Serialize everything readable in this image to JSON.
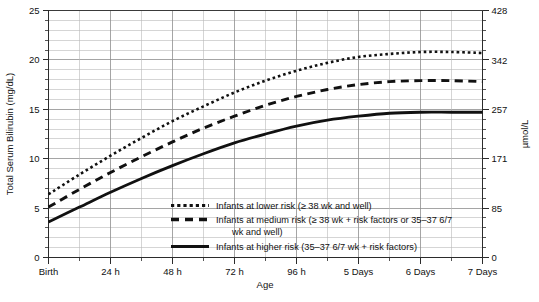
{
  "chart_data": {
    "type": "line",
    "title": "",
    "xlabel": "Age",
    "ylabel": "Total Serum Bilirubin (mg/dL)",
    "ylabel_right": "µmol/L",
    "grid": true,
    "legend_position": "inside-bottom-center",
    "x_tick_labels": [
      "Birth",
      "24 h",
      "48 h",
      "72 h",
      "96 h",
      "5 Days",
      "6 Days",
      "7 Days"
    ],
    "x_tick_hours": [
      0,
      24,
      48,
      72,
      96,
      120,
      144,
      168
    ],
    "xlim_hours": [
      0,
      168
    ],
    "y_tick_labels": [
      "0",
      "5",
      "10",
      "15",
      "20",
      "25"
    ],
    "y_tick_values": [
      0,
      5,
      10,
      15,
      20,
      25
    ],
    "ylim": [
      0,
      25
    ],
    "y_right_tick_labels": [
      "0",
      "85",
      "171",
      "257",
      "342",
      "428"
    ],
    "y_right_tick_values": [
      0,
      85,
      171,
      257,
      342,
      428
    ],
    "y_right_lim": [
      0,
      428
    ],
    "x": [
      0,
      12,
      24,
      36,
      48,
      60,
      72,
      84,
      96,
      108,
      120,
      132,
      144,
      156,
      168
    ],
    "series": [
      {
        "name": "Infants at lower risk (≥ 38 wk and well)",
        "style": "dotted",
        "values": [
          6.4,
          8.4,
          10.3,
          12.1,
          13.8,
          15.3,
          16.7,
          17.9,
          18.9,
          19.7,
          20.3,
          20.6,
          20.8,
          20.8,
          20.7
        ]
      },
      {
        "name": "Infants at medium risk (≥ 38 wk + risk factors or 35–37 6/7 wk and well)",
        "style": "dashed",
        "values": [
          5.1,
          6.9,
          8.6,
          10.2,
          11.7,
          13.1,
          14.3,
          15.4,
          16.3,
          17.0,
          17.5,
          17.8,
          17.9,
          17.9,
          17.8
        ]
      },
      {
        "name": "Infants at higher risk (35–37 6/7 wk + risk factors)",
        "style": "solid",
        "values": [
          3.6,
          5.1,
          6.6,
          8.0,
          9.3,
          10.5,
          11.6,
          12.5,
          13.3,
          13.9,
          14.3,
          14.6,
          14.7,
          14.7,
          14.7
        ]
      }
    ]
  },
  "legend": {
    "items": [
      {
        "style": "dotted",
        "label": "Infants at lower risk (≥ 38 wk and well)",
        "label_line2": ""
      },
      {
        "style": "dashed",
        "label": "Infants at medium risk (≥ 38 wk + risk factors or 35–37 6/7",
        "label_line2": "wk and well)"
      },
      {
        "style": "solid",
        "label": "Infants at higher risk (35–37 6/7 wk + risk factors)",
        "label_line2": ""
      }
    ]
  },
  "colors": {
    "curve": "#111111",
    "grid": "#b9b9b9",
    "grid_major": "#8f8f8f",
    "frame": "#3a3a3a",
    "background": "#ffffff",
    "text": "#111111"
  }
}
